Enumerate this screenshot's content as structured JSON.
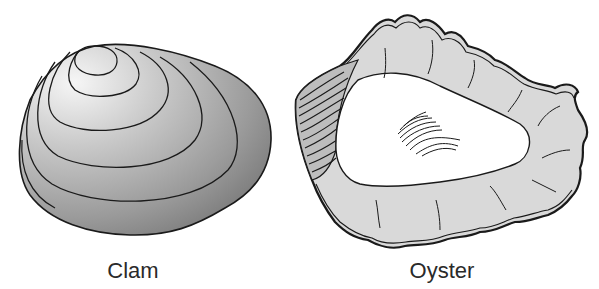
{
  "figure": {
    "items": [
      {
        "id": "clam",
        "label": "Clam"
      },
      {
        "id": "oyster",
        "label": "Oyster"
      }
    ]
  },
  "colors": {
    "background": "#ffffff",
    "outline": "#1a1a1a",
    "clam_light": "#f4f4f4",
    "clam_dark": "#7a7a7a",
    "oyster_shell": "#d9d9d9",
    "oyster_interior": "#ffffff"
  }
}
